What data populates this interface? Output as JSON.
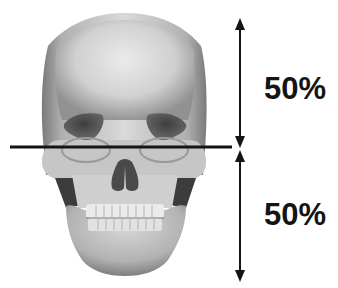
{
  "diagram": {
    "divider": {
      "orientation": "horizontal",
      "position": "eye-level"
    },
    "upper_section": {
      "label": "50%",
      "arrow": "double-headed-vertical"
    },
    "lower_section": {
      "label": "50%",
      "arrow": "double-headed-vertical"
    },
    "colors": {
      "background": "#ffffff",
      "line": "#141414",
      "text": "#141414",
      "bone_light": "#e4e4e4",
      "bone_mid": "#b4b4b4",
      "bone_dark": "#6a6a6a",
      "cavity": "#4a4a4a"
    }
  }
}
